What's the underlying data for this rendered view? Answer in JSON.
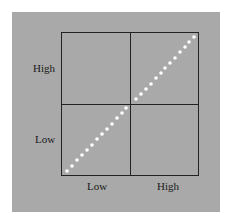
{
  "diagram": {
    "type": "2x2 quadrant diagram with diagonal dotted line",
    "y_axis_labels": {
      "high": "High",
      "low": "Low"
    },
    "x_axis_labels": {
      "low": "Low",
      "high": "High"
    },
    "colors": {
      "background": "#ffffff",
      "panel": "#a9a9a9",
      "grid_lines": "#222222",
      "dots": "#ffffff",
      "text": "#1a1a1a"
    },
    "diagonal": {
      "style": "dotted",
      "from": "bottom-left",
      "to": "top-right",
      "dot_count": 26
    }
  }
}
